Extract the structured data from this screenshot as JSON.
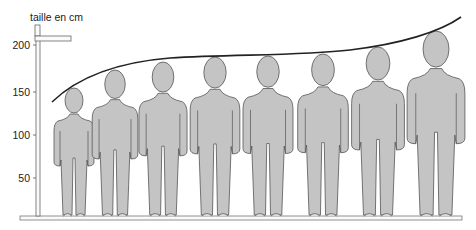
{
  "diagram": {
    "axis_title": "taille en cm",
    "ticks": [
      {
        "label": "200",
        "value": 200,
        "y": 45
      },
      {
        "label": "150",
        "value": 150,
        "y": 92
      },
      {
        "label": "100",
        "value": 100,
        "y": 135
      },
      {
        "label": "50",
        "value": 50,
        "y": 178
      }
    ],
    "colors": {
      "figure_fill": "#c4c4c4",
      "figure_stroke": "#555555",
      "curve": "#222222",
      "lines": "#666666"
    },
    "figures": [
      {
        "id": 1,
        "cx": 74,
        "head_top": 88,
        "approx_height_cm": 150
      },
      {
        "id": 2,
        "cx": 115,
        "head_top": 70,
        "approx_height_cm": 171
      },
      {
        "id": 3,
        "cx": 163,
        "head_top": 62,
        "approx_height_cm": 180
      },
      {
        "id": 4,
        "cx": 215,
        "head_top": 57,
        "approx_height_cm": 186
      },
      {
        "id": 5,
        "cx": 268,
        "head_top": 56,
        "approx_height_cm": 187
      },
      {
        "id": 6,
        "cx": 323,
        "head_top": 54,
        "approx_height_cm": 189
      },
      {
        "id": 7,
        "cx": 378,
        "head_top": 47,
        "approx_height_cm": 198
      },
      {
        "id": 8,
        "cx": 436,
        "head_top": 31,
        "approx_height_cm": 215
      }
    ]
  }
}
